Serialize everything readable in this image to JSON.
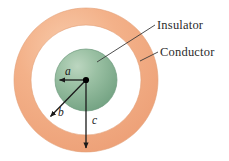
{
  "figure": {
    "center": {
      "x": 86,
      "y": 80
    },
    "background_color": "#ffffff"
  },
  "shapes": {
    "inner_sphere": {
      "name": "insulator-sphere",
      "radius_label": "a",
      "radius_px": 31,
      "fill_color": "#7fa98c",
      "highlight_color": "#b9d2bd",
      "edge_color": "#5f8a6e"
    },
    "outer_shell": {
      "name": "conductor-shell",
      "inner_radius_label": "b",
      "outer_radius_label": "c",
      "inner_radius_px": 55,
      "outer_radius_px": 72,
      "fill_color": "#f0a97e",
      "highlight_color": "#f7c6a5",
      "edge_color": "#e09a6d"
    },
    "gap": {
      "name": "vacuum-gap",
      "fill_color": "#ffffff"
    }
  },
  "labels": {
    "insulator": "Insulator",
    "conductor": "Conductor"
  },
  "radii": [
    {
      "symbol": "a",
      "description": "radius of inner insulating sphere"
    },
    {
      "symbol": "b",
      "description": "inner radius of conducting shell"
    },
    {
      "symbol": "c",
      "description": "outer radius of conducting shell"
    }
  ],
  "annotations": {
    "center_dot_color": "#000000",
    "arrow_color": "#1a1a1a",
    "leader_color": "#3a3a3a"
  }
}
